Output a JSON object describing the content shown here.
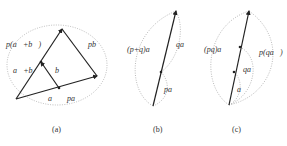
{
  "figure": {
    "panels": [
      {
        "id": "a",
        "caption": "(a)",
        "labels": {
          "p_a_plus_b": "p(a⃗+b⃗)",
          "p_b": "pb⃗",
          "a_plus_b": "a⃗+b⃗",
          "b": "b⃗",
          "a": "a⃗",
          "p_a": "pa⃗"
        }
      },
      {
        "id": "b",
        "caption": "(b)",
        "labels": {
          "p_plus_q_a": "(p+q)a⃗",
          "q_a": "qa⃗",
          "p_a": "pa⃗"
        }
      },
      {
        "id": "c",
        "caption": "(c)",
        "labels": {
          "pq_a": "(pq)a⃗",
          "p_qa": "p(qa⃗)",
          "q_a": "qa⃗",
          "a": "a⃗"
        }
      }
    ]
  }
}
